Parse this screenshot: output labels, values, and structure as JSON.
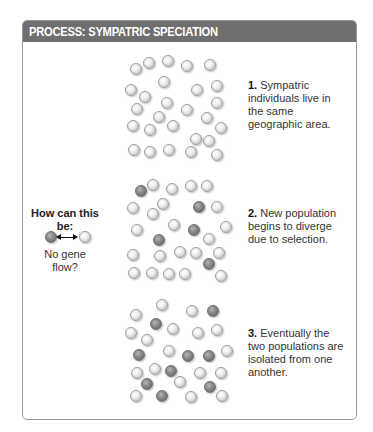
{
  "header": {
    "title": "PROCESS: SYMPATRIC SPECIATION"
  },
  "steps": [
    {
      "number": "1.",
      "text": "Sympatric individuals live in the same geographic area."
    },
    {
      "number": "2.",
      "text": "New population begins to diverge due to selection."
    },
    {
      "number": "3.",
      "text": "Eventually the two populations are isolated from one another."
    }
  ],
  "question": {
    "title": "How can this be:",
    "caption": "No gene flow?",
    "icon": "double-headed-arrow-between-two-individuals"
  },
  "colors": {
    "header_bg": "#6f6f6f",
    "header_text": "#ffffff",
    "frame_border": "#9a9a9a",
    "light_individual": "#e6e6e6",
    "dark_individual": "#7a7a7a"
  },
  "panels": [
    {
      "name": "panel-1",
      "balls": [
        [
          136,
          69,
          0
        ],
        [
          149,
          63,
          0
        ],
        [
          168,
          61,
          0
        ],
        [
          187,
          66,
          0
        ],
        [
          210,
          65,
          0
        ],
        [
          164,
          82,
          0
        ],
        [
          131,
          90,
          0
        ],
        [
          145,
          97,
          0
        ],
        [
          197,
          90,
          0
        ],
        [
          217,
          86,
          0
        ],
        [
          137,
          109,
          0
        ],
        [
          167,
          103,
          0
        ],
        [
          187,
          110,
          0
        ],
        [
          217,
          103,
          0
        ],
        [
          159,
          117,
          0
        ],
        [
          207,
          118,
          0
        ],
        [
          133,
          126,
          0
        ],
        [
          150,
          130,
          0
        ],
        [
          173,
          126,
          0
        ],
        [
          221,
          128,
          0
        ],
        [
          196,
          139,
          0
        ],
        [
          209,
          141,
          0
        ],
        [
          134,
          150,
          0
        ],
        [
          150,
          152,
          0
        ],
        [
          169,
          150,
          0
        ],
        [
          191,
          152,
          0
        ],
        [
          217,
          155,
          0
        ]
      ]
    },
    {
      "name": "panel-2",
      "balls": [
        [
          141,
          191,
          1
        ],
        [
          153,
          185,
          0
        ],
        [
          172,
          189,
          0
        ],
        [
          191,
          186,
          0
        ],
        [
          207,
          186,
          0
        ],
        [
          163,
          204,
          0
        ],
        [
          133,
          208,
          0
        ],
        [
          153,
          214,
          0
        ],
        [
          199,
          207,
          1
        ],
        [
          217,
          207,
          0
        ],
        [
          137,
          230,
          0
        ],
        [
          174,
          225,
          0
        ],
        [
          194,
          230,
          1
        ],
        [
          226,
          227,
          0
        ],
        [
          159,
          240,
          1
        ],
        [
          209,
          239,
          0
        ],
        [
          133,
          255,
          0
        ],
        [
          160,
          256,
          0
        ],
        [
          180,
          252,
          0
        ],
        [
          196,
          253,
          0
        ],
        [
          219,
          253,
          0
        ],
        [
          209,
          264,
          1
        ],
        [
          134,
          273,
          0
        ],
        [
          152,
          273,
          0
        ],
        [
          169,
          274,
          0
        ],
        [
          185,
          274,
          0
        ],
        [
          221,
          276,
          0
        ]
      ]
    },
    {
      "name": "panel-3",
      "balls": [
        [
          136,
          315,
          0
        ],
        [
          162,
          305,
          0
        ],
        [
          192,
          311,
          0
        ],
        [
          213,
          311,
          1
        ],
        [
          156,
          324,
          1
        ],
        [
          173,
          329,
          0
        ],
        [
          131,
          333,
          0
        ],
        [
          147,
          340,
          0
        ],
        [
          198,
          333,
          0
        ],
        [
          217,
          330,
          0
        ],
        [
          139,
          355,
          1
        ],
        [
          169,
          351,
          0
        ],
        [
          188,
          356,
          1
        ],
        [
          209,
          356,
          1
        ],
        [
          227,
          351,
          0
        ],
        [
          137,
          373,
          0
        ],
        [
          155,
          369,
          0
        ],
        [
          171,
          371,
          1
        ],
        [
          200,
          373,
          0
        ],
        [
          221,
          373,
          0
        ],
        [
          147,
          384,
          1
        ],
        [
          180,
          382,
          0
        ],
        [
          210,
          387,
          1
        ],
        [
          136,
          396,
          0
        ],
        [
          162,
          396,
          1
        ],
        [
          191,
          397,
          0
        ],
        [
          222,
          396,
          0
        ]
      ]
    }
  ]
}
